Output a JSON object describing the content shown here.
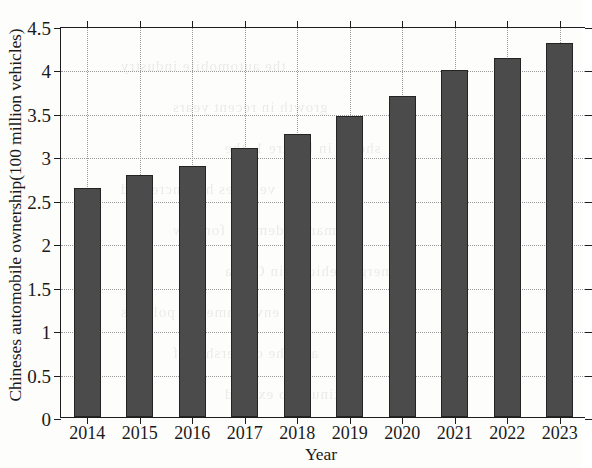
{
  "chart_data": {
    "type": "bar",
    "title": "",
    "xlabel": "Year",
    "ylabel": "Chineses automobile ownership(100 million vehicles)",
    "categories": [
      "2014",
      "2015",
      "2016",
      "2017",
      "2018",
      "2019",
      "2020",
      "2021",
      "2022",
      "2023"
    ],
    "values": [
      2.64,
      2.79,
      2.89,
      3.1,
      3.26,
      3.46,
      3.7,
      3.99,
      4.13,
      4.31
    ],
    "series": [
      {
        "name": "Chineses automobile ownership",
        "values": [
          2.64,
          2.79,
          2.89,
          3.1,
          3.26,
          3.46,
          3.7,
          3.99,
          4.13,
          4.31
        ]
      }
    ],
    "ylim": [
      0,
      4.5
    ],
    "ytick_labels": [
      "0",
      "0.5",
      "1",
      "1.5",
      "2",
      "2.5",
      "3",
      "3.5",
      "4",
      "4.5"
    ],
    "ytick_values": [
      0,
      0.5,
      1,
      1.5,
      2,
      2.5,
      3,
      3.5,
      4,
      4.5
    ],
    "grid": true,
    "grid_style": "dotted",
    "legend": "none",
    "bar_color": "#4b4b4b",
    "bar_edge_color": "#242424",
    "axis_color": "#1d1d1d",
    "background_color": "#fdfdfc"
  },
  "ghost_text": [
    "the automobile industry",
    "growth in recent years",
    "shown in Figure 1, the",
    "vehicles has increased",
    "market demand for new",
    "energy vehicles in China",
    "environmental policies",
    "and the ownership of",
    "continues to expand"
  ]
}
